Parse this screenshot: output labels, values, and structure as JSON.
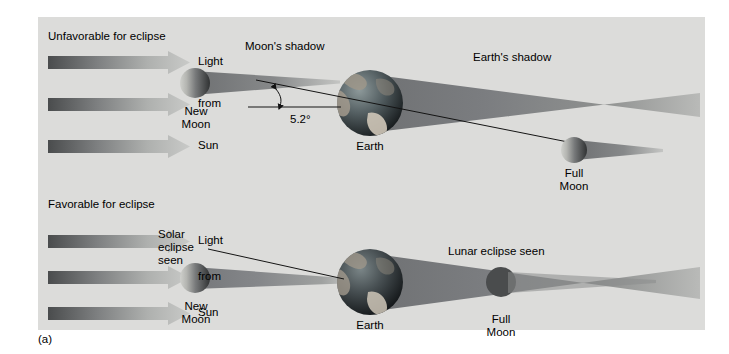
{
  "figure": {
    "caption": "(a)",
    "background_color": "#dcdcda",
    "page_color": "#ffffff"
  },
  "panels": [
    {
      "id": "unfavorable",
      "heading": "Unfavorable for eclipse",
      "sunlight_arrows": [
        "Light",
        "from",
        "Sun"
      ],
      "bodies": [
        {
          "name": "new-moon",
          "label": "New\nMoon"
        },
        {
          "name": "earth",
          "label": "Earth"
        },
        {
          "name": "full-moon",
          "label": "Full\nMoon"
        }
      ],
      "shadow_labels": [
        "Moon's shadow",
        "Earth's shadow"
      ],
      "angle": {
        "value": "5.2°",
        "meaning": "inclination-of-moons-orbit"
      }
    },
    {
      "id": "favorable",
      "heading": "Favorable for eclipse",
      "sunlight_arrows": [
        "Light",
        "from",
        "Sun"
      ],
      "bodies": [
        {
          "name": "new-moon",
          "label": "New\nMoon"
        },
        {
          "name": "earth",
          "label": "Earth"
        },
        {
          "name": "full-moon",
          "label": "Full\nMoon"
        }
      ],
      "event_labels": [
        "Solar\neclipse\nseen",
        "Lunar eclipse seen"
      ]
    }
  ],
  "labels": {
    "unfavorable_heading": "Unfavorable for eclipse",
    "favorable_heading": "Favorable for eclipse",
    "light_top": "Light",
    "from_top": "from",
    "sun_top": "Sun",
    "light_bottom": "Light",
    "from_bottom": "from",
    "sun_bottom": "Sun",
    "moons_shadow": "Moon's shadow",
    "earths_shadow": "Earth's shadow",
    "angle": "5.2°",
    "new_moon_top_line1": "New",
    "new_moon_top_line2": "Moon",
    "earth_top": "Earth",
    "full_moon_top_line1": "Full",
    "full_moon_top_line2": "Moon",
    "solar_eclipse_line1": "Solar",
    "solar_eclipse_line2": "eclipse",
    "solar_eclipse_line3": "seen",
    "lunar_eclipse": "Lunar eclipse seen",
    "new_moon_bottom_line1": "New",
    "new_moon_bottom_line2": "Moon",
    "earth_bottom": "Earth",
    "full_moon_bottom_line1": "Full",
    "full_moon_bottom_line2": "Moon",
    "caption": "(a)"
  },
  "colors": {
    "panel_bg": "#dcdcda",
    "shadow_dark": "#7b7d7e",
    "shadow_mid": "#9a9c9c",
    "shadow_light": "#c3c4c2",
    "arrow_dark": "#4d4f50",
    "arrow_light": "#c6c7c5",
    "text": "#000000",
    "line": "#1a1a1a",
    "moon_lit": "#c9cac6",
    "moon_dark": "#3a3c3d",
    "earth_ocean": "#3e4a4e",
    "earth_land": "#b9b0a2"
  }
}
